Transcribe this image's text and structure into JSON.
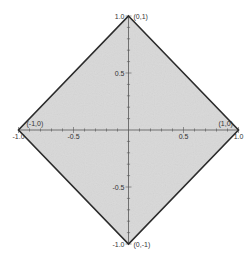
{
  "chart_data": {
    "type": "area",
    "title": "",
    "xlabel": "",
    "ylabel": "",
    "xlim": [
      -1.0,
      1.0
    ],
    "ylim": [
      -1.0,
      1.0
    ],
    "grid": false,
    "legend": null,
    "shape": "diamond (unit ball of L1 norm, |x|+|y| <= 1)",
    "vertices": [
      {
        "x": 0,
        "y": 1,
        "label": "(0,1)"
      },
      {
        "x": 1,
        "y": 0,
        "label": "(1,0)"
      },
      {
        "x": 0,
        "y": -1,
        "label": "(0,-1)"
      },
      {
        "x": -1,
        "y": 0,
        "label": "(-1,0)"
      }
    ],
    "x_ticks": [
      -1.0,
      -0.5,
      0.5,
      1.0
    ],
    "x_tick_labels": [
      "-1.0",
      "-0.5",
      "0.5",
      "1.0"
    ],
    "y_ticks": [
      1.0,
      0.5,
      -0.5,
      -1.0
    ],
    "y_tick_labels": [
      "1.0",
      "0.5",
      "-0.5",
      "-1.0"
    ],
    "fill_color": "#d9d9d9",
    "edge_color": "#2b2b2b",
    "axis_color": "#555555"
  }
}
